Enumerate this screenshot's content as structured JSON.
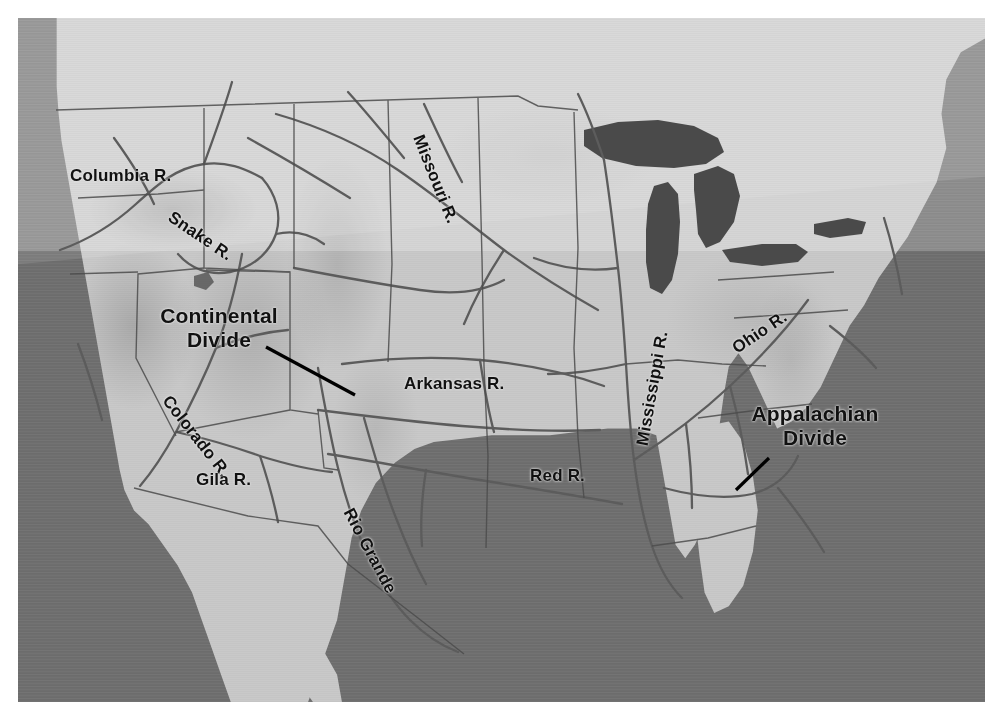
{
  "figure": {
    "plate": {
      "x": 18,
      "y": 18,
      "width": 967,
      "height": 684
    }
  },
  "colors": {
    "ocean": "#6e6e6e",
    "land": "#c6c6c6",
    "land_highland": "#8f8f8f",
    "lake": "#4e4e4e",
    "river_line": "#5a5a5a",
    "border_line": "#4a4a4a",
    "label_text": "#111111",
    "leader_line": "#000000",
    "paper": "#ffffff"
  },
  "labels": {
    "rivers": [
      {
        "name": "columbia",
        "text": "Columbia R.",
        "x": 52,
        "y": 148,
        "rotate": 0,
        "size": 17
      },
      {
        "name": "snake",
        "text": "Snake R.",
        "x": 152,
        "y": 188,
        "rotate": 34,
        "size": 17
      },
      {
        "name": "missouri",
        "text": "Missouri R.",
        "x": 400,
        "y": 108,
        "rotate": 68,
        "size": 17
      },
      {
        "name": "mississippi",
        "text": "Mississippi R.",
        "x": 624,
        "y": 418,
        "rotate": -80,
        "size": 17
      },
      {
        "name": "ohio",
        "text": "Ohio R.",
        "x": 716,
        "y": 322,
        "rotate": -34,
        "size": 17
      },
      {
        "name": "arkansas",
        "text": "Arkansas R.",
        "x": 386,
        "y": 356,
        "rotate": 0,
        "size": 17
      },
      {
        "name": "red",
        "text": "Red R.",
        "x": 512,
        "y": 448,
        "rotate": 0,
        "size": 17
      },
      {
        "name": "colorado",
        "text": "Colorado R.",
        "x": 148,
        "y": 370,
        "rotate": 52,
        "size": 17
      },
      {
        "name": "gila",
        "text": "Gila R.",
        "x": 178,
        "y": 452,
        "rotate": 0,
        "size": 17
      },
      {
        "name": "rio-grande",
        "text": "Rio Grande",
        "x": 330,
        "y": 482,
        "rotate": 62,
        "size": 17
      }
    ],
    "divides": [
      {
        "name": "continental-divide",
        "line1": "Continental",
        "line2": "Divide",
        "x": 152,
        "y": 296,
        "size": 21,
        "leader": {
          "x1": 248,
          "y1": 329,
          "x2": 337,
          "y2": 377
        }
      },
      {
        "name": "appalachian-divide",
        "line1": "Appalachian",
        "line2": "Divide",
        "x": 748,
        "y": 402,
        "size": 21,
        "leader": {
          "x1": 751,
          "y1": 440,
          "x2": 718,
          "y2": 472
        }
      }
    ]
  },
  "features": {
    "water_bodies": [
      "Pacific Ocean",
      "Atlantic Ocean",
      "Gulf of Mexico",
      "Gulf of California",
      "Great Lakes"
    ],
    "rivers_depicted": [
      "Columbia R.",
      "Snake R.",
      "Missouri R.",
      "Mississippi R.",
      "Ohio R.",
      "Arkansas R.",
      "Red R.",
      "Colorado R.",
      "Gila R.",
      "Rio Grande"
    ],
    "divides_depicted": [
      "Continental Divide",
      "Appalachian Divide"
    ]
  }
}
